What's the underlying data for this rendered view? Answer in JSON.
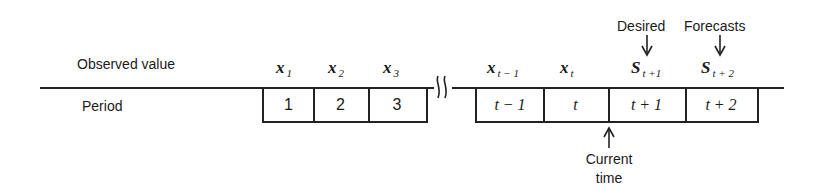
{
  "row_labels": {
    "observed": "Observed value",
    "period": "Period"
  },
  "observed_values": [
    {
      "base": "x",
      "sub": "1"
    },
    {
      "base": "x",
      "sub": "2"
    },
    {
      "base": "x",
      "sub": "3"
    },
    {
      "base": "x",
      "sub": "t − 1"
    },
    {
      "base": "x",
      "sub": "t"
    },
    {
      "base": "S",
      "sub": "t +1"
    },
    {
      "base": "S",
      "sub": "t + 2"
    }
  ],
  "periods": [
    "1",
    "2",
    "3",
    "t − 1",
    "t",
    "t + 1",
    "t + 2"
  ],
  "annotations": {
    "desired": "Desired",
    "forecasts": "Forecasts",
    "current_line1": "Current",
    "current_line2": "time"
  },
  "break_symbol": "≀≀"
}
